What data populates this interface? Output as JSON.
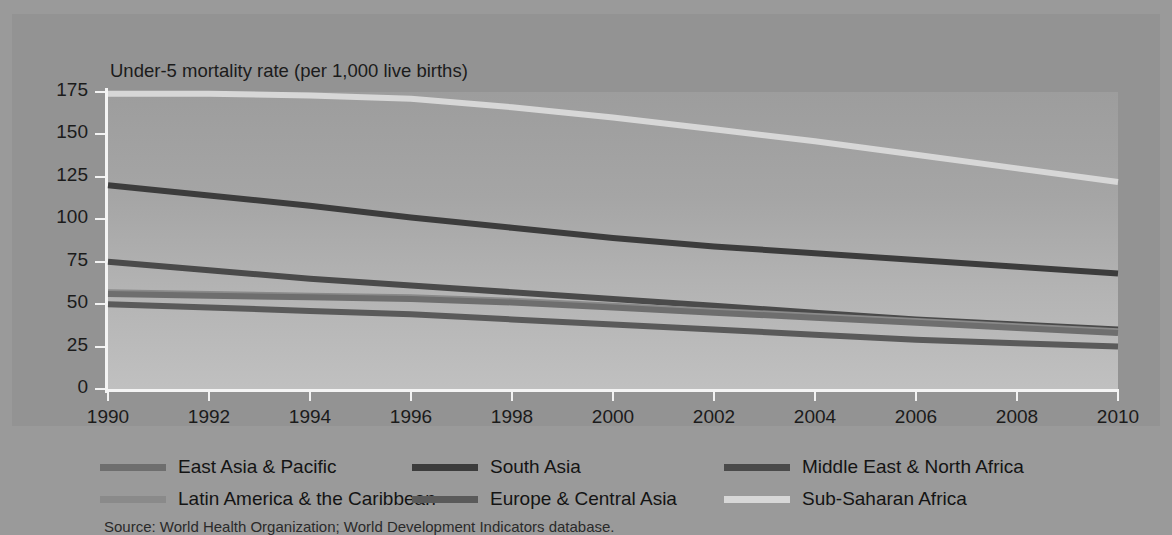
{
  "chart_data": {
    "type": "line",
    "title": "Under-5 mortality rate (per 1,000 live births)",
    "xlabel": "",
    "ylabel": "Under-5 mortality rate (per 1,000 live births)",
    "xlim": [
      1990,
      2010
    ],
    "ylim": [
      0,
      175
    ],
    "yticks": [
      0,
      25,
      50,
      75,
      100,
      125,
      150,
      175
    ],
    "xticks": [
      1990,
      1992,
      1994,
      1996,
      1998,
      2000,
      2002,
      2004,
      2006,
      2008,
      2010
    ],
    "x": [
      1990,
      1992,
      1994,
      1996,
      1998,
      2000,
      2002,
      2004,
      2006,
      2008,
      2010
    ],
    "grid": false,
    "legend_position": "bottom",
    "series": [
      {
        "name": "Sub-Saharan Africa",
        "color": "#d7d7d7",
        "values": [
          174,
          174,
          173,
          171,
          166,
          160,
          153,
          146,
          138,
          130,
          122
        ]
      },
      {
        "name": "South Asia",
        "color": "#3c3c3c",
        "values": [
          120,
          114,
          108,
          101,
          95,
          89,
          84,
          80,
          76,
          72,
          68
        ]
      },
      {
        "name": "Middle East & North Africa",
        "color": "#4a4a4a",
        "values": [
          75,
          70,
          65,
          61,
          57,
          53,
          49,
          45,
          41,
          38,
          35
        ]
      },
      {
        "name": "Latin America & the Caribbean",
        "color": "#8a8a8a",
        "values": [
          57,
          56,
          55,
          54,
          52,
          49,
          46,
          43,
          40,
          37,
          34
        ]
      },
      {
        "name": "East Asia & Pacific",
        "color": "#6e6e6e",
        "values": [
          56,
          55,
          54,
          53,
          51,
          48,
          45,
          42,
          39,
          36,
          33
        ]
      },
      {
        "name": "Europe & Central Asia",
        "color": "#5a5a5a",
        "values": [
          50,
          48,
          46,
          44,
          41,
          38,
          35,
          32,
          29,
          27,
          25
        ]
      }
    ]
  },
  "chart": {
    "title": "Under-5 mortality rate (per 1,000 live births)",
    "y_labels": [
      "175",
      "150",
      "125",
      "100",
      "75",
      "50",
      "25",
      "0"
    ],
    "x_labels": [
      "1990",
      "1992",
      "1994",
      "1996",
      "1998",
      "2000",
      "2002",
      "2004",
      "2006",
      "2008",
      "2010"
    ]
  },
  "legend": {
    "items": [
      {
        "label": "East Asia & Pacific",
        "color": "#6e6e6e"
      },
      {
        "label": "South Asia",
        "color": "#3c3c3c"
      },
      {
        "label": "Middle East & North Africa",
        "color": "#4a4a4a"
      },
      {
        "label": "Latin America & the Caribbean",
        "color": "#8a8a8a"
      },
      {
        "label": "Europe & Central Asia",
        "color": "#5a5a5a"
      },
      {
        "label": "Sub-Saharan Africa",
        "color": "#d7d7d7"
      }
    ]
  },
  "footer": {
    "source": "Source: World Health Organization; World Development Indicators database."
  }
}
